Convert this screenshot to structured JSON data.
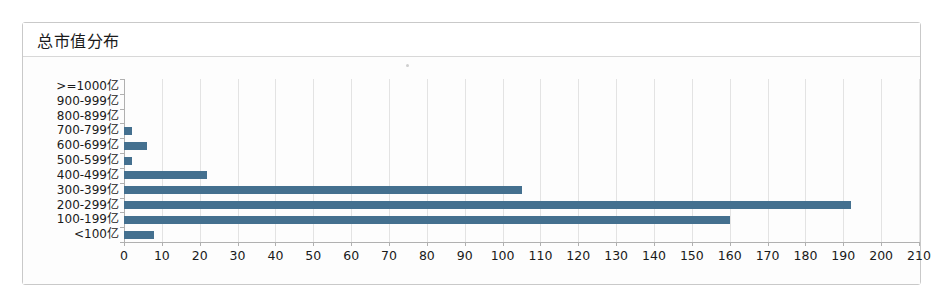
{
  "panel": {
    "title": "总市值分布"
  },
  "chart_data": {
    "type": "bar",
    "orientation": "horizontal",
    "title": "总市值分布",
    "xlabel": "",
    "ylabel": "",
    "categories": [
      ">=1000亿",
      "900-999亿",
      "800-899亿",
      "700-799亿",
      "600-699亿",
      "500-599亿",
      "400-499亿",
      "300-399亿",
      "200-299亿",
      "100-199亿",
      "<100亿"
    ],
    "values": [
      0,
      0,
      0,
      2,
      6,
      2,
      22,
      105,
      192,
      160,
      8
    ],
    "xlim": [
      0,
      210
    ],
    "xticks": [
      0,
      10,
      20,
      30,
      40,
      50,
      60,
      70,
      80,
      90,
      100,
      110,
      120,
      130,
      140,
      150,
      160,
      170,
      180,
      190,
      200,
      210
    ],
    "xtick_labels": [
      "0",
      "10",
      "20",
      "30",
      "40",
      "50",
      "60",
      "70",
      "80",
      "90",
      "100",
      "110",
      "120",
      "130",
      "140",
      "150",
      "160",
      "170",
      "180",
      "190",
      "200",
      "210"
    ],
    "grid": true,
    "legend": false,
    "bar_color": "#44708f",
    "grid_color": "#e3e3e3",
    "axis_color": "#b0b0b0"
  }
}
